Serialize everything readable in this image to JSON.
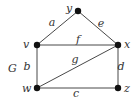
{
  "graph": {
    "name": "G",
    "nodes": [
      {
        "id": "y",
        "x": 78,
        "y": 11,
        "lx": 66,
        "ly": 12
      },
      {
        "id": "v",
        "x": 37,
        "y": 45,
        "lx": 23,
        "ly": 48
      },
      {
        "id": "x",
        "x": 118,
        "y": 45,
        "lx": 124,
        "ly": 48
      },
      {
        "id": "w",
        "x": 37,
        "y": 88,
        "lx": 22,
        "ly": 92
      },
      {
        "id": "z",
        "x": 118,
        "y": 88,
        "lx": 124,
        "ly": 92
      }
    ],
    "edges": [
      {
        "id": "a",
        "from": "v",
        "to": "y",
        "lx": 52,
        "ly": 26
      },
      {
        "id": "e",
        "from": "y",
        "to": "x",
        "lx": 101,
        "ly": 27
      },
      {
        "id": "f",
        "from": "v",
        "to": "x",
        "lx": 78,
        "ly": 43
      },
      {
        "id": "b",
        "from": "v",
        "to": "w",
        "lx": 27,
        "ly": 70
      },
      {
        "id": "g",
        "from": "w",
        "to": "x",
        "lx": 75,
        "ly": 63
      },
      {
        "id": "d",
        "from": "x",
        "to": "z",
        "lx": 121,
        "ly": 70
      },
      {
        "id": "c",
        "from": "w",
        "to": "z",
        "lx": 76,
        "ly": 97
      }
    ],
    "graph_label": {
      "text": "G",
      "x": 8,
      "y": 72
    }
  }
}
